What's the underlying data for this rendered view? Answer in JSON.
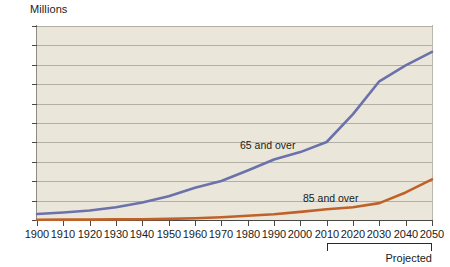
{
  "axis": {
    "unit_label": "Millions",
    "y_ticks": [
      "0",
      "10",
      "20",
      "30",
      "40",
      "50",
      "60",
      "70",
      "80",
      "90",
      "100"
    ],
    "x_ticks": [
      "1900",
      "1910",
      "1920",
      "1930",
      "1940",
      "1950",
      "1960",
      "1970",
      "1980",
      "1990",
      "2000",
      "2010",
      "2020",
      "2030",
      "2040",
      "2050"
    ]
  },
  "annotations": {
    "projected_label": "Projected",
    "series_65_label": "65 and over",
    "series_85_label": "85 and over"
  },
  "colors": {
    "plot_background": "#eae7da",
    "gridline": "#b2afa4",
    "series_65": "#6b72ab",
    "series_85": "#c0612a",
    "axis": "#4a4843",
    "text": "#1b1b1b",
    "page_background": "#ffffff"
  },
  "chart_data": {
    "type": "line",
    "title": "",
    "subtitle": "",
    "xlabel": "",
    "ylabel": "Millions",
    "xlim": [
      1900,
      2050
    ],
    "ylim": [
      0,
      100
    ],
    "grid": true,
    "legend": "inline-labels",
    "x": [
      1900,
      1910,
      1920,
      1930,
      1940,
      1950,
      1960,
      1970,
      1980,
      1990,
      2000,
      2010,
      2020,
      2030,
      2040,
      2050
    ],
    "series": [
      {
        "name": "65 and over",
        "color": "#6b72ab",
        "values": [
          3.1,
          3.9,
          4.9,
          6.6,
          9.0,
          12.3,
          16.6,
          20.1,
          25.5,
          31.2,
          35.0,
          40.2,
          54.6,
          71.5,
          79.7,
          86.7
        ]
      },
      {
        "name": "85 and over",
        "color": "#c0612a",
        "values": [
          0.1,
          0.2,
          0.2,
          0.3,
          0.4,
          0.6,
          0.9,
          1.4,
          2.2,
          3.0,
          4.2,
          5.5,
          6.6,
          8.7,
          14.2,
          20.9
        ]
      }
    ],
    "annotations": [
      {
        "text": "Projected",
        "type": "range-bracket",
        "x_start": 2010,
        "x_end": 2050
      }
    ]
  }
}
